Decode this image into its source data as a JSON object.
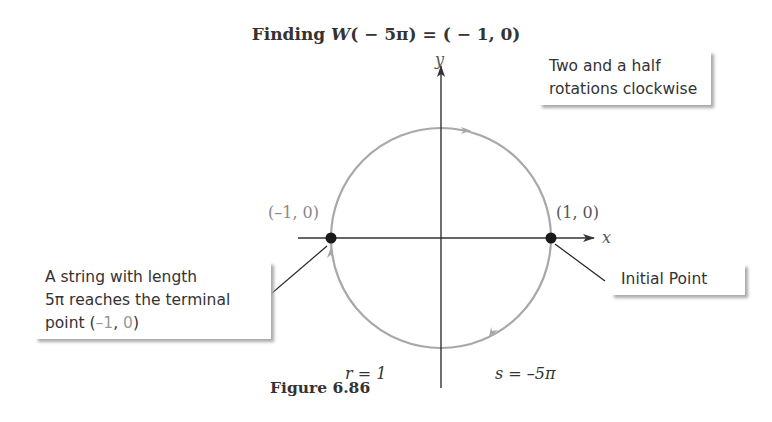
{
  "title": {
    "prefix": "Finding ",
    "func": "W",
    "args": "( − 5π)  =  ( − 1, 0)"
  },
  "axes": {
    "x_label": "x",
    "y_label": "y"
  },
  "points": {
    "left": {
      "label": "(–1, 0)"
    },
    "right": {
      "label": "(1, 0)"
    }
  },
  "callouts": {
    "top_right": {
      "line1": "Two and a half",
      "line2": "rotations clockwise"
    },
    "bottom_left": {
      "line1": "A string with length",
      "line2": "5π reaches the terminal",
      "line3_prefix": "point (",
      "line3_neg1": "–1",
      "line3_comma": ", ",
      "line3_zero": "0",
      "line3_suffix": ")"
    },
    "bottom_right": {
      "text": "Initial Point"
    }
  },
  "annotations": {
    "radius": "r = 1",
    "arc_length": "s = –5π"
  },
  "caption": "Figure 6.86",
  "colors": {
    "circle": "#a8a8a8",
    "axis": "#333333",
    "point": "#1a1a1a",
    "shadow": "#aaaaaa"
  }
}
